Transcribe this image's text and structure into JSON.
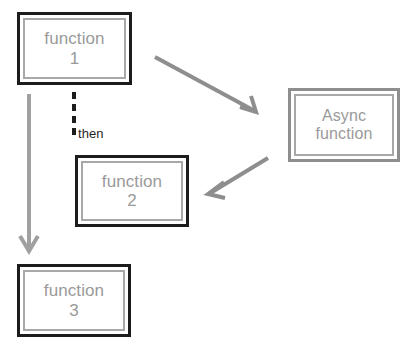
{
  "diagram": {
    "type": "flowchart",
    "background_color": "#ffffff",
    "colors": {
      "box_outer_dark": "#1c1c1c",
      "box_outer_gray": "#8e8e8e",
      "box_inner_border": "#a8a8a8",
      "box_label_text": "#9a9a9a",
      "arrow": "#8e8e8e",
      "dashed_connector": "#1c1c1c",
      "connector_label_text": "#1f1f1f"
    },
    "nodes": [
      {
        "id": "function-1",
        "label": "function\n1",
        "line1": "function",
        "line2": "1",
        "frame": "dark-outer-gray-inner"
      },
      {
        "id": "function-2",
        "label": "function\n2",
        "line1": "function",
        "line2": "2",
        "frame": "dark-outer-gray-inner"
      },
      {
        "id": "function-3",
        "label": "function\n3",
        "line1": "function",
        "line2": "3",
        "frame": "dark-outer-gray-inner"
      },
      {
        "id": "async-function",
        "label": "Async\nfunction",
        "line1": "Async",
        "line2": "function",
        "frame": "gray-outer-gray-inner"
      }
    ],
    "connectors": [
      {
        "id": "function-1-to-async-function",
        "style": "solid-arrow",
        "from": "function-1",
        "to": "async-function",
        "label": ""
      },
      {
        "id": "async-function-to-function-2",
        "style": "solid-arrow",
        "from": "async-function",
        "to": "function-2",
        "label": ""
      },
      {
        "id": "function-1-to-function-3",
        "style": "solid-arrow",
        "from": "function-1",
        "to": "function-3",
        "label": ""
      },
      {
        "id": "function-1-then-function-2",
        "style": "dashed",
        "from": "function-1",
        "to": "function-2",
        "label": "then"
      }
    ]
  }
}
